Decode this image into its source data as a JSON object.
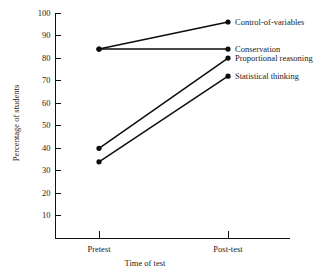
{
  "chart_data": {
    "type": "line",
    "title": "",
    "subtitle": "",
    "xlabel": "Time of test",
    "ylabel": "Percentage of students",
    "categories": [
      "Pretest",
      "Post-test"
    ],
    "xtick_labels": [
      "Pretest",
      "Post-test"
    ],
    "ytick_labels": [
      "10",
      "20",
      "30",
      "40",
      "50",
      "60",
      "70",
      "80",
      "90",
      "100"
    ],
    "ytick_values": [
      10,
      20,
      30,
      40,
      50,
      60,
      70,
      80,
      90,
      100
    ],
    "ylim": [
      0,
      100
    ],
    "grid": false,
    "legend_position": "right-inline",
    "marker": "filled-circle",
    "line_color": "#0d0d0d",
    "series": [
      {
        "name": "Control-of-variables",
        "label": "Control-of-variables",
        "values": [
          84,
          96
        ],
        "color": "#0d0d0d"
      },
      {
        "name": "Conservation",
        "label": "Conservation",
        "values": [
          84,
          84
        ],
        "color": "#0d0d0d"
      },
      {
        "name": "Proportional reasoning",
        "label": "Proportional reasoning",
        "values": [
          40,
          80
        ],
        "color": "#0d0d0d"
      },
      {
        "name": "Statistical thinking",
        "label": "Statistical thinking",
        "values": [
          34,
          72
        ],
        "color": "#0d0d0d"
      }
    ]
  }
}
